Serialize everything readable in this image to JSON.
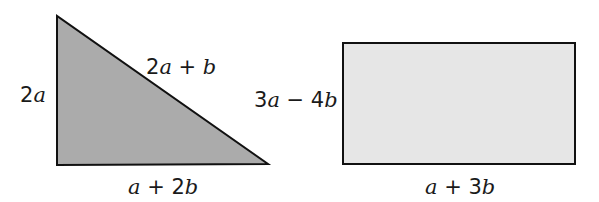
{
  "shapes": {
    "triangle": {
      "points": [
        [
          57,
          16
        ],
        [
          57,
          165
        ],
        [
          268,
          164
        ]
      ],
      "fill": "#ababab",
      "stroke": "#111111",
      "labels": {
        "left_side": {
          "coef": "2",
          "var": "a",
          "tail": "",
          "tailvar": ""
        },
        "hypotenuse": {
          "coef": "2",
          "var": "a",
          "tail": " + ",
          "tailvar": "b"
        },
        "base": {
          "coef": "",
          "var": "a",
          "tail": " + 2",
          "tailvar": "b"
        }
      }
    },
    "rectangle": {
      "x": 343,
      "y": 43,
      "width": 232,
      "height": 121,
      "fill": "#e6e6e6",
      "stroke": "#111111",
      "labels": {
        "left_side": {
          "coef": "3",
          "var": "a",
          "tail": " − 4",
          "tailvar": "b"
        },
        "base": {
          "coef": "",
          "var": "a",
          "tail": " + 3",
          "tailvar": "b"
        }
      }
    }
  }
}
